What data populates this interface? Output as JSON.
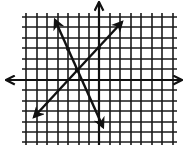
{
  "diagram": {
    "type": "coordinate-plane-two-lines",
    "colors": {
      "background": "#ffffff",
      "grid": "#1a1a1a",
      "axis": "#111111",
      "line": "#111111"
    },
    "grid": {
      "x_lines_px": [
        26,
        37,
        47,
        58,
        68,
        79,
        89,
        99,
        110,
        120,
        131,
        141,
        152,
        162,
        173
      ],
      "y_lines_px": [
        17,
        27,
        38,
        48,
        59,
        69,
        80,
        90,
        101,
        111,
        122,
        132,
        142
      ],
      "origin_px": [
        99,
        80
      ],
      "unit_px": 10.5
    },
    "axes": {
      "x_axis": {
        "from_px": [
          6,
          80
        ],
        "to_px": [
          182,
          80
        ],
        "arrows": "both"
      },
      "y_axis": {
        "from_px": [
          99,
          145
        ],
        "to_px": [
          99,
          2
        ],
        "arrows": "top"
      }
    },
    "lines": [
      {
        "name": "line-positive-slope",
        "from_px": [
          34,
          117
        ],
        "to_px": [
          122,
          22
        ],
        "arrows": "both",
        "slope_sign": "positive"
      },
      {
        "name": "line-negative-slope",
        "from_px": [
          55,
          20
        ],
        "to_px": [
          103,
          127
        ],
        "arrows": "both",
        "slope_sign": "negative"
      }
    ],
    "intersection": {
      "px": [
        77,
        70
      ],
      "coords": [
        -2,
        1
      ]
    },
    "points": [
      {
        "px": [
          68,
          49
        ]
      },
      {
        "px": [
          99,
          48
        ]
      }
    ]
  }
}
